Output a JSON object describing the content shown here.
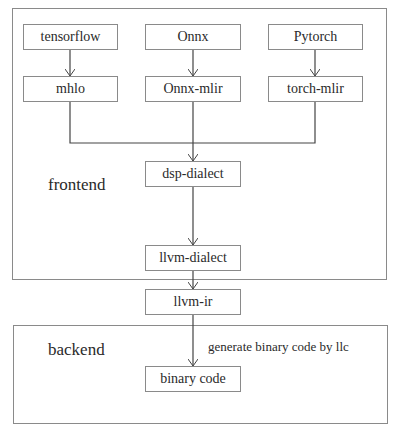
{
  "regions": {
    "frontend": {
      "label": "frontend"
    },
    "backend": {
      "label": "backend"
    }
  },
  "nodes": {
    "tensorflow": "tensorflow",
    "onnx": "Onnx",
    "pytorch": "Pytorch",
    "mhlo": "mhlo",
    "onnx_mlir": "Onnx-mlir",
    "torch_mlir": "torch-mlir",
    "dsp_dialect": "dsp-dialect",
    "llvm_dialect": "llvm-dialect",
    "llvm_ir": "llvm-ir",
    "binary_code": "binary code"
  },
  "edges": {
    "llc_label": "generate binary code by llc"
  }
}
